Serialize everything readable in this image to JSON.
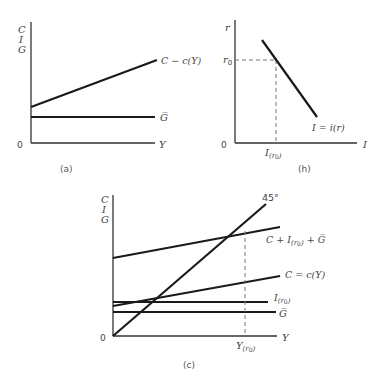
{
  "panels": {
    "a": {
      "caption": "(a)",
      "y_axis_labels": [
        "C",
        "I",
        "G"
      ],
      "origin": "0",
      "x_axis_label": "Y",
      "curves": {
        "consumption": "C − c(Y)",
        "government": "G̅"
      }
    },
    "b": {
      "caption": "(h)",
      "y_axis_label": "r",
      "origin": "0",
      "x_axis_label": "I",
      "r0_label_main": "r",
      "r0_label_sub": "0",
      "ir0_label_main": "I",
      "ir0_label_sub": "(r",
      "ir0_label_sub2": "0",
      "ir0_label_close": ")",
      "curves": {
        "investment": "I = i(r)"
      }
    },
    "c": {
      "caption": "(c)",
      "y_axis_labels": [
        "C",
        "I",
        "G"
      ],
      "origin": "0",
      "x_axis_label": "Y",
      "angle_label": "45°",
      "yr0_label_main": "Y",
      "yr0_label_sub": "(r",
      "yr0_label_sub2": "0",
      "yr0_label_close": ")",
      "curves": {
        "aggregate_main": "C + I",
        "aggregate_sub": "(r",
        "aggregate_sub2": "0",
        "aggregate_close": ")",
        "aggregate_tail": " + G̅",
        "consumption": "C = c(Y)",
        "investment_main": "I",
        "investment_sub": "(r",
        "investment_sub2": "0",
        "investment_close": ")",
        "government": "G̅"
      }
    }
  },
  "colors": {
    "line": "#1a1a1a",
    "axis": "#333333",
    "dashed": "#777777",
    "text": "#444444"
  }
}
